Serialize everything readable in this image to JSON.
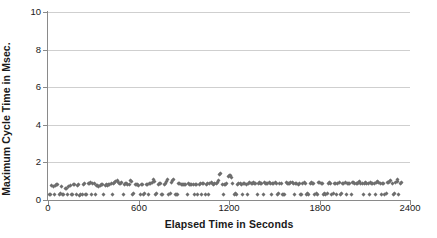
{
  "chart_data": {
    "type": "scatter",
    "title": "",
    "xlabel": "Elapsed Time in Seconds",
    "ylabel": "Maximum Cycle Time in Msec.",
    "xlim": [
      0,
      2400
    ],
    "ylim": [
      0,
      10
    ],
    "xticks": [
      0,
      600,
      1200,
      1800,
      2400
    ],
    "yticks": [
      0,
      2,
      4,
      6,
      8,
      10
    ],
    "xtick_labels": [
      "0",
      "600",
      "1200",
      "1800",
      "2400"
    ],
    "ytick_labels": [
      "0",
      "2",
      "4",
      "6",
      "8",
      "10"
    ],
    "grid": "horizontal",
    "grid_color": "#cfcfcf",
    "marker": "diamond",
    "marker_color": "#6e6e6e",
    "marker_size": 3,
    "legend": "none",
    "background": "#ffffff",
    "axis_color": "#8a8a8a",
    "text_color": "#1a1a1a",
    "series": [
      {
        "name": "Maximum Cycle Time",
        "points": [
          [
            8,
            0.3
          ],
          [
            18,
            0.28
          ],
          [
            26,
            0.75
          ],
          [
            34,
            0.72
          ],
          [
            42,
            0.3
          ],
          [
            50,
            0.78
          ],
          [
            58,
            0.8
          ],
          [
            66,
            0.85
          ],
          [
            74,
            0.3
          ],
          [
            82,
            0.32
          ],
          [
            90,
            0.72
          ],
          [
            98,
            0.3
          ],
          [
            106,
            0.28
          ],
          [
            114,
            0.62
          ],
          [
            122,
            0.6
          ],
          [
            130,
            0.3
          ],
          [
            138,
            0.72
          ],
          [
            146,
            0.78
          ],
          [
            154,
            0.3
          ],
          [
            162,
            0.28
          ],
          [
            170,
            0.8
          ],
          [
            178,
            0.82
          ],
          [
            186,
            0.3
          ],
          [
            194,
            0.78
          ],
          [
            202,
            0.8
          ],
          [
            210,
            0.26
          ],
          [
            218,
            0.28
          ],
          [
            226,
            0.3
          ],
          [
            234,
            0.85
          ],
          [
            242,
            0.9
          ],
          [
            250,
            0.3
          ],
          [
            258,
            0.3
          ],
          [
            266,
            0.88
          ],
          [
            274,
            0.9
          ],
          [
            282,
            0.95
          ],
          [
            290,
            0.3
          ],
          [
            298,
            0.88
          ],
          [
            306,
            0.9
          ],
          [
            314,
            0.3
          ],
          [
            322,
            0.75
          ],
          [
            330,
            0.78
          ],
          [
            338,
            0.72
          ],
          [
            346,
            0.76
          ],
          [
            354,
            0.8
          ],
          [
            362,
            0.82
          ],
          [
            370,
            0.3
          ],
          [
            378,
            0.78
          ],
          [
            386,
            0.8
          ],
          [
            394,
            0.76
          ],
          [
            402,
            0.8
          ],
          [
            410,
            0.85
          ],
          [
            418,
            0.88
          ],
          [
            426,
            0.3
          ],
          [
            434,
            0.9
          ],
          [
            442,
            0.92
          ],
          [
            450,
            1.0
          ],
          [
            458,
            1.05
          ],
          [
            466,
            0.95
          ],
          [
            474,
            0.88
          ],
          [
            482,
            0.9
          ],
          [
            490,
            0.92
          ],
          [
            498,
            0.3
          ],
          [
            506,
            0.85
          ],
          [
            514,
            0.88
          ],
          [
            522,
            0.9
          ],
          [
            530,
            0.85
          ],
          [
            538,
            0.82
          ],
          [
            546,
            1.05
          ],
          [
            554,
            1.0
          ],
          [
            562,
            0.3
          ],
          [
            570,
            0.32
          ],
          [
            578,
            0.85
          ],
          [
            586,
            0.8
          ],
          [
            594,
            0.82
          ],
          [
            602,
            0.78
          ],
          [
            610,
            0.3
          ],
          [
            618,
            0.8
          ],
          [
            626,
            0.85
          ],
          [
            634,
            0.3
          ],
          [
            642,
            0.32
          ],
          [
            650,
            0.82
          ],
          [
            658,
            0.85
          ],
          [
            666,
            0.3
          ],
          [
            674,
            0.88
          ],
          [
            682,
            0.9
          ],
          [
            690,
            0.92
          ],
          [
            698,
            1.1
          ],
          [
            706,
            1.0
          ],
          [
            714,
            0.3
          ],
          [
            722,
            0.32
          ],
          [
            730,
            0.85
          ],
          [
            738,
            0.88
          ],
          [
            746,
            0.9
          ],
          [
            754,
            0.3
          ],
          [
            762,
            0.28
          ],
          [
            770,
            0.85
          ],
          [
            778,
            0.9
          ],
          [
            786,
            1.0
          ],
          [
            794,
            1.1
          ],
          [
            802,
            0.3
          ],
          [
            810,
            0.32
          ],
          [
            818,
            0.95
          ],
          [
            826,
            1.05
          ],
          [
            834,
            1.1
          ],
          [
            842,
            0.3
          ],
          [
            850,
            0.28
          ],
          [
            858,
            0.3
          ],
          [
            866,
            0.88
          ],
          [
            874,
            0.9
          ],
          [
            882,
            0.85
          ],
          [
            890,
            0.82
          ],
          [
            898,
            0.8
          ],
          [
            906,
            0.85
          ],
          [
            914,
            0.82
          ],
          [
            922,
            0.3
          ],
          [
            930,
            0.88
          ],
          [
            938,
            0.85
          ],
          [
            946,
            0.82
          ],
          [
            954,
            0.8
          ],
          [
            962,
            0.85
          ],
          [
            970,
            0.3
          ],
          [
            978,
            0.82
          ],
          [
            986,
            0.8
          ],
          [
            994,
            0.3
          ],
          [
            1002,
            0.85
          ],
          [
            1010,
            0.88
          ],
          [
            1018,
            0.3
          ],
          [
            1026,
            0.9
          ],
          [
            1034,
            0.88
          ],
          [
            1042,
            0.3
          ],
          [
            1050,
            0.85
          ],
          [
            1058,
            0.88
          ],
          [
            1066,
            0.3
          ],
          [
            1074,
            0.9
          ],
          [
            1082,
            0.92
          ],
          [
            1090,
            0.88
          ],
          [
            1098,
            0.85
          ],
          [
            1106,
            0.88
          ],
          [
            1114,
            0.9
          ],
          [
            1122,
            0.95
          ],
          [
            1130,
            1.05
          ],
          [
            1138,
            1.35
          ],
          [
            1146,
            1.4
          ],
          [
            1154,
            0.85
          ],
          [
            1162,
            0.3
          ],
          [
            1170,
            0.82
          ],
          [
            1178,
            0.85
          ],
          [
            1186,
            0.88
          ],
          [
            1194,
            1.25
          ],
          [
            1202,
            1.3
          ],
          [
            1210,
            1.28
          ],
          [
            1218,
            1.22
          ],
          [
            1226,
            0.9
          ],
          [
            1234,
            0.3
          ],
          [
            1242,
            0.32
          ],
          [
            1250,
            0.3
          ],
          [
            1258,
            0.85
          ],
          [
            1266,
            0.88
          ],
          [
            1274,
            0.9
          ],
          [
            1282,
            0.85
          ],
          [
            1290,
            0.3
          ],
          [
            1298,
            0.88
          ],
          [
            1306,
            0.9
          ],
          [
            1314,
            0.85
          ],
          [
            1322,
            0.3
          ],
          [
            1330,
            0.9
          ],
          [
            1338,
            0.92
          ],
          [
            1346,
            0.88
          ],
          [
            1354,
            0.9
          ],
          [
            1362,
            0.95
          ],
          [
            1370,
            0.9
          ],
          [
            1378,
            0.88
          ],
          [
            1386,
            0.3
          ],
          [
            1394,
            0.9
          ],
          [
            1402,
            0.92
          ],
          [
            1410,
            0.88
          ],
          [
            1418,
            0.9
          ],
          [
            1426,
            0.3
          ],
          [
            1434,
            0.92
          ],
          [
            1442,
            0.9
          ],
          [
            1450,
            0.88
          ],
          [
            1458,
            0.9
          ],
          [
            1466,
            0.92
          ],
          [
            1474,
            0.9
          ],
          [
            1482,
            0.3
          ],
          [
            1490,
            0.88
          ],
          [
            1498,
            0.9
          ],
          [
            1506,
            0.92
          ],
          [
            1514,
            0.9
          ],
          [
            1522,
            0.3
          ],
          [
            1530,
            0.32
          ],
          [
            1538,
            0.88
          ],
          [
            1546,
            0.9
          ],
          [
            1554,
            0.3
          ],
          [
            1562,
            0.3
          ],
          [
            1570,
            0.3
          ],
          [
            1578,
            0.92
          ],
          [
            1586,
            0.9
          ],
          [
            1594,
            0.88
          ],
          [
            1602,
            0.9
          ],
          [
            1610,
            0.95
          ],
          [
            1618,
            0.92
          ],
          [
            1626,
            0.9
          ],
          [
            1634,
            0.3
          ],
          [
            1642,
            0.88
          ],
          [
            1650,
            0.9
          ],
          [
            1658,
            0.85
          ],
          [
            1666,
            0.88
          ],
          [
            1674,
            0.3
          ],
          [
            1682,
            0.3
          ],
          [
            1690,
            0.9
          ],
          [
            1698,
            0.92
          ],
          [
            1706,
            0.88
          ],
          [
            1714,
            0.3
          ],
          [
            1722,
            0.32
          ],
          [
            1730,
            0.3
          ],
          [
            1738,
            0.9
          ],
          [
            1746,
            0.92
          ],
          [
            1754,
            0.88
          ],
          [
            1762,
            0.9
          ],
          [
            1770,
            0.3
          ],
          [
            1778,
            0.35
          ],
          [
            1786,
            0.3
          ],
          [
            1794,
            0.92
          ],
          [
            1802,
            0.95
          ],
          [
            1810,
            0.9
          ],
          [
            1818,
            0.88
          ],
          [
            1826,
            0.3
          ],
          [
            1834,
            0.35
          ],
          [
            1842,
            0.3
          ],
          [
            1850,
            0.32
          ],
          [
            1858,
            0.9
          ],
          [
            1866,
            0.92
          ],
          [
            1874,
            0.88
          ],
          [
            1882,
            0.3
          ],
          [
            1890,
            0.32
          ],
          [
            1898,
            0.9
          ],
          [
            1906,
            0.88
          ],
          [
            1914,
            0.3
          ],
          [
            1922,
            0.9
          ],
          [
            1930,
            0.92
          ],
          [
            1938,
            0.3
          ],
          [
            1946,
            0.32
          ],
          [
            1954,
            0.88
          ],
          [
            1962,
            0.9
          ],
          [
            1970,
            0.92
          ],
          [
            1978,
            0.3
          ],
          [
            1986,
            0.9
          ],
          [
            1994,
            0.88
          ],
          [
            2002,
            0.9
          ],
          [
            2010,
            0.3
          ],
          [
            2018,
            0.92
          ],
          [
            2026,
            0.95
          ],
          [
            2034,
            0.9
          ],
          [
            2042,
            0.88
          ],
          [
            2050,
            0.9
          ],
          [
            2058,
            0.95
          ],
          [
            2066,
            1.0
          ],
          [
            2074,
            0.9
          ],
          [
            2082,
            0.88
          ],
          [
            2090,
            0.3
          ],
          [
            2098,
            0.9
          ],
          [
            2106,
            0.92
          ],
          [
            2114,
            0.88
          ],
          [
            2122,
            0.9
          ],
          [
            2130,
            0.3
          ],
          [
            2138,
            0.92
          ],
          [
            2146,
            0.9
          ],
          [
            2154,
            0.88
          ],
          [
            2162,
            0.9
          ],
          [
            2170,
            0.3
          ],
          [
            2178,
            0.95
          ],
          [
            2186,
            1.0
          ],
          [
            2194,
            0.92
          ],
          [
            2202,
            0.9
          ],
          [
            2210,
            0.3
          ],
          [
            2218,
            0.88
          ],
          [
            2226,
            0.9
          ],
          [
            2234,
            0.3
          ],
          [
            2242,
            0.32
          ],
          [
            2250,
            0.92
          ],
          [
            2258,
            0.95
          ],
          [
            2266,
            1.0
          ],
          [
            2274,
            1.05
          ],
          [
            2282,
            0.9
          ],
          [
            2290,
            0.3
          ],
          [
            2298,
            0.32
          ],
          [
            2306,
            0.95
          ],
          [
            2314,
            1.0
          ],
          [
            2320,
            1.1
          ],
          [
            2326,
            0.3
          ],
          [
            2334,
            0.9
          ],
          [
            2342,
            0.92
          ]
        ]
      }
    ]
  }
}
